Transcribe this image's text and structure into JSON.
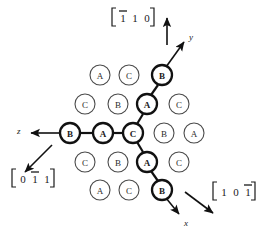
{
  "figure": {
    "background_color": "#ffffff",
    "line_color": "#111111",
    "circle_stroke_color": "#4a4a4a",
    "bold_stroke_color": "#111111",
    "width": 257,
    "height": 235
  },
  "atoms": [
    {
      "label": "A",
      "cx": 100,
      "cy": 75,
      "r": 10,
      "bold": false
    },
    {
      "label": "C",
      "cx": 129,
      "cy": 75,
      "r": 10,
      "bold": false
    },
    {
      "label": "B",
      "cx": 162,
      "cy": 75,
      "r": 10,
      "bold": true
    },
    {
      "label": "C",
      "cx": 85,
      "cy": 104,
      "r": 10,
      "bold": false
    },
    {
      "label": "B",
      "cx": 118,
      "cy": 104,
      "r": 10,
      "bold": false
    },
    {
      "label": "A",
      "cx": 147,
      "cy": 104,
      "r": 10,
      "bold": true
    },
    {
      "label": "C",
      "cx": 179,
      "cy": 104,
      "r": 10,
      "bold": false
    },
    {
      "label": "B",
      "cx": 70,
      "cy": 133,
      "r": 10,
      "bold": true
    },
    {
      "label": "A",
      "cx": 103,
      "cy": 133,
      "r": 10,
      "bold": true
    },
    {
      "label": "C",
      "cx": 133,
      "cy": 133,
      "r": 10,
      "bold": true
    },
    {
      "label": "B",
      "cx": 164,
      "cy": 133,
      "r": 10,
      "bold": false
    },
    {
      "label": "A",
      "cx": 194,
      "cy": 133,
      "r": 10,
      "bold": false
    },
    {
      "label": "C",
      "cx": 85,
      "cy": 162,
      "r": 10,
      "bold": false
    },
    {
      "label": "B",
      "cx": 118,
      "cy": 162,
      "r": 10,
      "bold": false
    },
    {
      "label": "A",
      "cx": 147,
      "cy": 162,
      "r": 10,
      "bold": true
    },
    {
      "label": "C",
      "cx": 179,
      "cy": 162,
      "r": 10,
      "bold": false
    },
    {
      "label": "A",
      "cx": 100,
      "cy": 190,
      "r": 10,
      "bold": false
    },
    {
      "label": "C",
      "cx": 129,
      "cy": 190,
      "r": 10,
      "bold": false
    },
    {
      "label": "B",
      "cx": 162,
      "cy": 190,
      "r": 10,
      "bold": true
    }
  ],
  "bonds": [
    {
      "name": "bond-z-chain-b-a",
      "x1": 80,
      "y1": 133,
      "x2": 93,
      "y2": 133
    },
    {
      "name": "bond-z-chain-a-c",
      "x1": 113,
      "y1": 133,
      "x2": 123,
      "y2": 133
    },
    {
      "name": "bond-y-chain-c-a",
      "x1": 137,
      "y1": 124,
      "x2": 143,
      "y2": 114
    },
    {
      "name": "bond-y-chain-a-b",
      "x1": 151,
      "y1": 95,
      "x2": 158,
      "y2": 85
    },
    {
      "name": "bond-x-chain-c-a",
      "x1": 137,
      "y1": 142,
      "x2": 143,
      "y2": 152
    },
    {
      "name": "bond-x-chain-a-b",
      "x1": 151,
      "y1": 171,
      "x2": 158,
      "y2": 181
    }
  ],
  "axes": [
    {
      "name": "y",
      "label": "y",
      "label_x": 189,
      "label_y": 37,
      "line": {
        "x1": 166,
        "y1": 67,
        "x2": 184,
        "y2": 42
      }
    },
    {
      "name": "x",
      "label": "x",
      "label_x": 184,
      "label_y": 223,
      "line": {
        "x1": 166,
        "y1": 198,
        "x2": 179,
        "y2": 214
      }
    },
    {
      "name": "z",
      "label": "z",
      "label_x": 17,
      "label_y": 131,
      "line": {
        "x1": 60,
        "y1": 133,
        "x2": 31,
        "y2": 133
      }
    }
  ],
  "direction_arrows": [
    {
      "name": "arrow-110-vertical-up",
      "x1": 167,
      "y1": 45,
      "x2": 167,
      "y2": 18
    },
    {
      "name": "arrow-011-down-left",
      "x1": 52,
      "y1": 145,
      "x2": 25,
      "y2": 172
    },
    {
      "name": "arrow-101-down-right",
      "x1": 185,
      "y1": 192,
      "x2": 213,
      "y2": 213
    }
  ],
  "miller_labels": [
    {
      "name": "miller-index-110",
      "text": "[1 1 0]",
      "digits": [
        "1",
        "1",
        "0"
      ],
      "overbar_on": [
        0
      ],
      "x": 112,
      "y": 17
    },
    {
      "name": "miller-index-0-11",
      "text": "[0 1 1]",
      "digits": [
        "0",
        "1",
        "1"
      ],
      "overbar_on": [
        1
      ],
      "x": 12,
      "y": 178
    },
    {
      "name": "miller-index-10-1",
      "text": "[1 0 1]",
      "digits": [
        "1",
        "0",
        "1"
      ],
      "overbar_on": [
        2
      ],
      "x": 213,
      "y": 191
    }
  ]
}
